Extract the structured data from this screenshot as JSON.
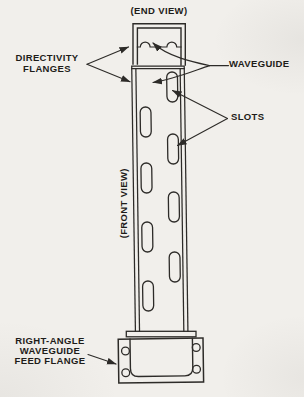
{
  "palette": {
    "background": "#f1efeb",
    "line": "#2d2b28",
    "text": "#1e1c19"
  },
  "labels": {
    "end_view": "(END VIEW)",
    "front_view": "(FRONT VIEW)",
    "directivity_flanges": {
      "line1": "DIRECTIVITY",
      "line2": "FLANGES"
    },
    "waveguide": "WAVEGUIDE",
    "slots": "SLOTS",
    "feed_flange": {
      "line1": "RIGHT-ANGLE",
      "line2": "WAVEGUIDE",
      "line3": "FEED FLANGE"
    }
  },
  "structure": {
    "slot_count": 8,
    "slot_columns": 2,
    "bolt_hole_count": 4,
    "end_view_bump_count": 2
  }
}
